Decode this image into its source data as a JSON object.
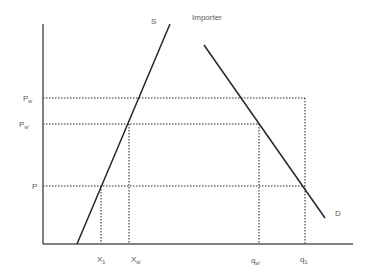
{
  "diagram": {
    "title": "Importer",
    "curves": {
      "supply": {
        "label": "S",
        "x1": 77,
        "y1": 244,
        "x2": 170,
        "y2": 24
      },
      "demand": {
        "label": "D",
        "x1": 204,
        "y1": 45,
        "x2": 325,
        "y2": 218
      }
    },
    "axes": {
      "origin": {
        "x": 43,
        "y": 244
      },
      "y_top": 24,
      "x_right": 353
    },
    "price_levels": [
      {
        "name": "Pw",
        "main": "P",
        "sub": "w",
        "y": 98,
        "x_end": 305
      },
      {
        "name": "Pw'",
        "main": "P",
        "sub": "w'",
        "y": 124,
        "x_end": 259
      },
      {
        "name": "P",
        "main": "P",
        "sub": "",
        "y": 186,
        "x_end": 305
      }
    ],
    "quantity_levels": [
      {
        "name": "X1",
        "main": "X",
        "sub": "1",
        "x": 101,
        "y_top": 186
      },
      {
        "name": "Xw'",
        "main": "X",
        "sub": "w'",
        "x": 129,
        "y_top": 124
      },
      {
        "name": "qw'",
        "main": "q",
        "sub": "w'",
        "x": 259,
        "y_top": 124
      },
      {
        "name": "q1",
        "main": "q",
        "sub": "1",
        "x": 305,
        "y_top": 98
      }
    ],
    "colors": {
      "axis": "#595959",
      "curve": "#262626",
      "dotted": "#262626",
      "text": "#595959"
    }
  }
}
